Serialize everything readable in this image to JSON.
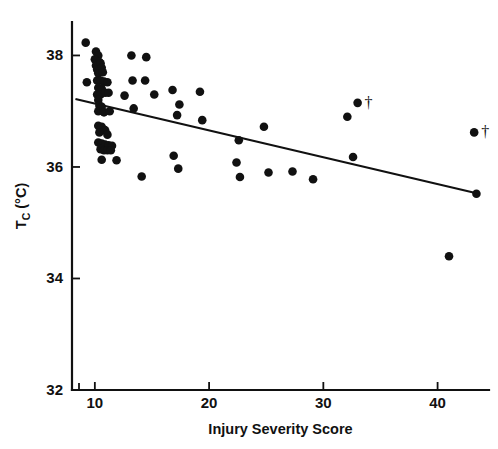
{
  "chart_data": {
    "type": "scatter",
    "title": "",
    "xlabel": "Injury Severity Score",
    "ylabel": "T_C (°C)",
    "ylabel_base": "T",
    "ylabel_sub": "C",
    "ylabel_unit": " (°C)",
    "xlim": [
      8.0,
      44.5
    ],
    "ylim": [
      32,
      38.6
    ],
    "xticks": [
      10,
      20,
      30,
      40
    ],
    "xtick_labels": [
      "10",
      "20",
      "30",
      "40"
    ],
    "yticks": [
      32,
      34,
      36,
      38
    ],
    "ytick_labels": [
      "32",
      "34",
      "36",
      "38"
    ],
    "grid": false,
    "legend": "none",
    "marker": "filled-circle",
    "marker_color": "#111111",
    "axis_color": "#111111",
    "background": "#ffffff",
    "annotation_symbol": "†",
    "annotation_note": "dagger marks two points",
    "trendline": {
      "type": "linear",
      "x_start": 8.3,
      "y_start": 37.22,
      "x_end": 43.6,
      "y_end": 35.52
    },
    "points": [
      {
        "x": 9.2,
        "y": 38.23
      },
      {
        "x": 10.1,
        "y": 38.07
      },
      {
        "x": 10.3,
        "y": 38.0
      },
      {
        "x": 10.0,
        "y": 37.93
      },
      {
        "x": 10.4,
        "y": 37.88
      },
      {
        "x": 10.1,
        "y": 37.82
      },
      {
        "x": 10.5,
        "y": 37.86
      },
      {
        "x": 10.2,
        "y": 37.75
      },
      {
        "x": 10.6,
        "y": 37.78
      },
      {
        "x": 10.3,
        "y": 37.68
      },
      {
        "x": 10.7,
        "y": 37.7
      },
      {
        "x": 9.3,
        "y": 37.52
      },
      {
        "x": 10.2,
        "y": 37.55
      },
      {
        "x": 10.5,
        "y": 37.55
      },
      {
        "x": 10.8,
        "y": 37.53
      },
      {
        "x": 11.1,
        "y": 37.52
      },
      {
        "x": 10.3,
        "y": 37.42
      },
      {
        "x": 10.6,
        "y": 37.4
      },
      {
        "x": 10.2,
        "y": 37.3
      },
      {
        "x": 10.5,
        "y": 37.3
      },
      {
        "x": 10.9,
        "y": 37.33
      },
      {
        "x": 11.2,
        "y": 37.33
      },
      {
        "x": 10.3,
        "y": 37.2
      },
      {
        "x": 10.4,
        "y": 37.1
      },
      {
        "x": 10.6,
        "y": 37.08
      },
      {
        "x": 10.3,
        "y": 37.0
      },
      {
        "x": 10.8,
        "y": 36.98
      },
      {
        "x": 11.3,
        "y": 37.0
      },
      {
        "x": 10.3,
        "y": 36.74
      },
      {
        "x": 10.6,
        "y": 36.72
      },
      {
        "x": 10.9,
        "y": 36.66
      },
      {
        "x": 10.4,
        "y": 36.62
      },
      {
        "x": 11.1,
        "y": 36.58
      },
      {
        "x": 10.3,
        "y": 36.44
      },
      {
        "x": 10.6,
        "y": 36.42
      },
      {
        "x": 10.9,
        "y": 36.4
      },
      {
        "x": 11.2,
        "y": 36.39
      },
      {
        "x": 11.5,
        "y": 36.38
      },
      {
        "x": 10.5,
        "y": 36.32
      },
      {
        "x": 10.8,
        "y": 36.3
      },
      {
        "x": 11.1,
        "y": 36.3
      },
      {
        "x": 11.4,
        "y": 36.3
      },
      {
        "x": 10.6,
        "y": 36.13
      },
      {
        "x": 11.9,
        "y": 36.12
      },
      {
        "x": 13.2,
        "y": 38.0
      },
      {
        "x": 14.5,
        "y": 37.97
      },
      {
        "x": 13.3,
        "y": 37.55
      },
      {
        "x": 14.4,
        "y": 37.55
      },
      {
        "x": 12.6,
        "y": 37.28
      },
      {
        "x": 15.2,
        "y": 37.3
      },
      {
        "x": 13.4,
        "y": 37.05
      },
      {
        "x": 16.8,
        "y": 37.38
      },
      {
        "x": 17.4,
        "y": 37.12
      },
      {
        "x": 19.2,
        "y": 37.35
      },
      {
        "x": 17.2,
        "y": 36.93
      },
      {
        "x": 19.4,
        "y": 36.84
      },
      {
        "x": 14.1,
        "y": 35.83
      },
      {
        "x": 16.9,
        "y": 36.2
      },
      {
        "x": 17.3,
        "y": 35.97
      },
      {
        "x": 22.6,
        "y": 36.48
      },
      {
        "x": 22.4,
        "y": 36.08
      },
      {
        "x": 22.7,
        "y": 35.82
      },
      {
        "x": 24.8,
        "y": 36.72
      },
      {
        "x": 25.2,
        "y": 35.9
      },
      {
        "x": 27.3,
        "y": 35.92
      },
      {
        "x": 29.1,
        "y": 35.78
      },
      {
        "x": 32.6,
        "y": 36.18
      },
      {
        "x": 33.0,
        "y": 37.15,
        "marked": true
      },
      {
        "x": 32.1,
        "y": 36.9
      },
      {
        "x": 43.2,
        "y": 36.62,
        "marked": true
      },
      {
        "x": 43.4,
        "y": 35.52
      },
      {
        "x": 41.0,
        "y": 34.4
      }
    ]
  }
}
